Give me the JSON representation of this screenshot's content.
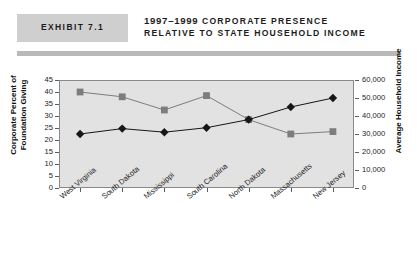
{
  "header": {
    "exhibit_label": "EXHIBIT 7.1",
    "title_line_1_year": "1997–1999",
    "title_line_1_rest": " CORPORATE PRESENCE",
    "title_line_2": "RELATIVE TO STATE HOUSEHOLD INCOME"
  },
  "chart_data": {
    "type": "line",
    "title": "1997–1999 CORPORATE PRESENCE RELATIVE TO STATE HOUSEHOLD INCOME",
    "xlabel": "",
    "categories": [
      "West Virginia",
      "South Dakota",
      "Mississippi",
      "South Carolina",
      "North Dakota",
      "Massachusetts",
      "New Jersey"
    ],
    "grid": false,
    "legend": "none",
    "series": [
      {
        "name": "Corporate Percent of Foundation Giving",
        "axis": "left",
        "marker": "square",
        "color": "#7d7d7d",
        "values": [
          40,
          38,
          32.5,
          38.5,
          28.5,
          22.5,
          23.5
        ]
      },
      {
        "name": "Average Household Income",
        "axis": "right",
        "marker": "diamond",
        "color": "#161616",
        "values": [
          30000,
          33000,
          31000,
          33500,
          38000,
          45000,
          50000
        ]
      }
    ],
    "left_axis": {
      "label": "Corporate Percent of Foundation Giving",
      "min": 0,
      "max": 45,
      "step": 5,
      "ticks": [
        "45",
        "40",
        "35",
        "30",
        "25",
        "20",
        "15",
        "10",
        "5",
        "0"
      ]
    },
    "right_axis": {
      "label": "Average Household Income",
      "min": 0,
      "max": 60000,
      "step": 10000,
      "ticks": [
        "60,000",
        "50,000",
        "40,000",
        "30,000",
        "20,000",
        "10,000",
        "0"
      ]
    }
  }
}
